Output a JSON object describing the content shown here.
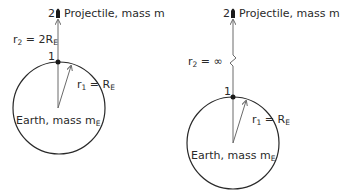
{
  "colors": {
    "stroke": "#2a2a2a",
    "arrow": "#6a6a6a",
    "background": "#ffffff"
  },
  "panels": [
    {
      "id": "left",
      "projectile": {
        "point_label": "2",
        "text": "Projectile, mass m"
      },
      "r2": {
        "prefix": "r",
        "sub": "2",
        "eq": " = 2R",
        "sub2": "E"
      },
      "point1": {
        "label": "1"
      },
      "r1": {
        "prefix": "r",
        "sub": "1",
        "eq": " = R",
        "sub2": "E"
      },
      "earth": {
        "text": "Earth, mass m",
        "sub": "E"
      }
    },
    {
      "id": "right",
      "projectile": {
        "point_label": "2",
        "text": "Projectile, mass m"
      },
      "r2": {
        "prefix": "r",
        "sub": "2",
        "eq": " = ∞"
      },
      "point1": {
        "label": "1"
      },
      "r1": {
        "prefix": "r",
        "sub": "1",
        "eq": " = R",
        "sub2": "E"
      },
      "earth": {
        "text": "Earth, mass m",
        "sub": "E"
      }
    }
  ]
}
